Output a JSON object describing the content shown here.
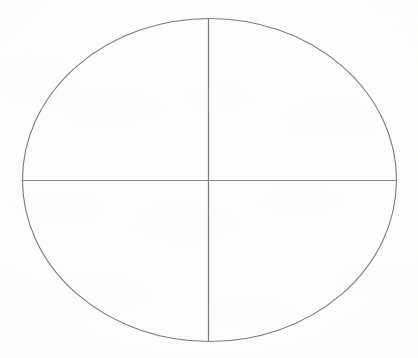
{
  "canvas": {
    "width": 418,
    "height": 358,
    "background_color": "#fbfbfa",
    "description": "Hand-drawn style ellipse divided into four quadrants by a vertical and a horizontal diameter, on lightly textured off-white paper."
  },
  "figure": {
    "stroke_color": "#7b7b7d",
    "stroke_color_light": "#8b8b8d",
    "stroke_width": 1.1
  },
  "shapes": {
    "ellipse": {
      "name": "circle-outline",
      "center_x": 209.5,
      "center_y": 180,
      "radius_x": 187,
      "radius_y": 161.5,
      "left_x": 22.5,
      "right_x": 396.5,
      "top_y": 18.5,
      "bottom_y": 341.5,
      "stroke": "#7b7b7d",
      "stroke_width": 1.1,
      "fill": "none"
    },
    "vertical_diameter": {
      "name": "vertical-divider-line",
      "x1": 208.5,
      "y1": 19.0,
      "x2": 208.5,
      "y2": 341.0,
      "stroke": "#7b7b7d",
      "stroke_width": 1.2
    },
    "horizontal_diameter": {
      "name": "horizontal-divider-line",
      "x1": 23.0,
      "y1": 180.5,
      "x2": 396.0,
      "y2": 180.5,
      "stroke": "#8b8b8d",
      "stroke_width": 1.0
    }
  },
  "quadrants": [
    {
      "name": "quadrant-top-left",
      "label": ""
    },
    {
      "name": "quadrant-top-right",
      "label": ""
    },
    {
      "name": "quadrant-bottom-left",
      "label": ""
    },
    {
      "name": "quadrant-bottom-right",
      "label": ""
    }
  ],
  "text_elements": []
}
